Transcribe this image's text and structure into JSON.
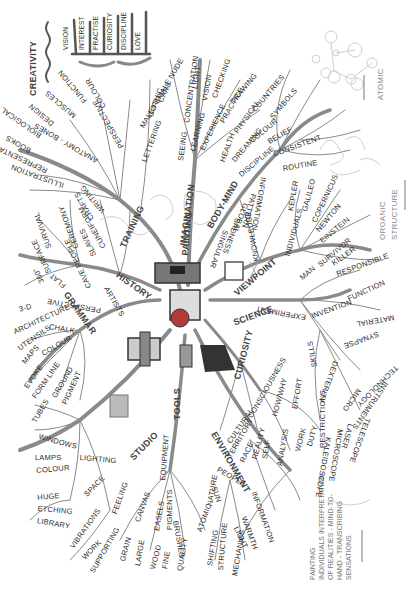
{
  "central_topic": "Painting",
  "legend": {
    "creativity": "CREATIVITY",
    "bars": [
      "VISION",
      "INTEREST",
      "PRACTISE",
      "CURIOSITY",
      "DISCIPLINE",
      "LOVE"
    ]
  },
  "corner_labels": {
    "atomic": "ATOMIC",
    "organic_structure_1": "ORGANIC",
    "organic_structure_2": "STRUCTURE"
  },
  "definition": {
    "title": "PAINTING",
    "lines": [
      "INDIVIDUALS INTERPRETATION",
      "OF REALITIES - MIND-TO-",
      "HAND - TRANSCRIBING",
      "SENSATIONS."
    ]
  },
  "branches": {
    "training": {
      "label": "TRAINING",
      "sub": {
        "illustration": "ILLUSTRATION",
        "representational": "REPRESENTATIONAL",
        "books": "BOOKS",
        "biological": "BIOLOGICAL",
        "design": "DESIGN",
        "anatomy": "ANATOMY - BONES",
        "muscles": "MUSCLES",
        "function": "FUNCTION",
        "perspective": "PERSPECTIVE",
        "colour": "COLOUR",
        "lettering": "LETTERING",
        "gothic": "GOTHIC",
        "cars": "CARS",
        "male_female_nude": "MALE/FEMALE NUDE"
      }
    },
    "imagination": {
      "label": "IMAGINATION",
      "sub": {
        "seeing": "SEEING",
        "concentration": "CONCENTRATION",
        "light": "LIGHT",
        "vision": "VISION",
        "checking": "CHECKING",
        "learning": "LEARNING",
        "experience": "EXPERIENCE",
        "practice": "PRACTICE",
        "drawing": "DRAWING"
      }
    },
    "body_mind": {
      "label": "BODY-MIND",
      "sub": {
        "health": "HEALTH",
        "physical": "PHYSICAL",
        "countries": "COUNTRIES",
        "dreaming": "DREAMING",
        "colour": "COLOUR",
        "symbols": "SYMBOLS",
        "discipline": "DISCIPLINE",
        "belief": "BELIEF",
        "consistent": "CONSISTENT",
        "routine": "ROUTINE"
      }
    },
    "viewpoint": {
      "label": "VIEWPOINT",
      "sub": {
        "knowledge": "KNOWLEDGE",
        "singular": "SINGULAR",
        "sadness": "SADNESS",
        "global": "GLOBAL",
        "pattern": "PATTERN",
        "information": "INFORMATION",
        "individuals": "INDIVIDUALS",
        "kepler": "KEPLER",
        "galileo": "GALILEO",
        "copernicus": "COPERNICUS",
        "newton": "NEWTON",
        "einstein": "EINSTEIN",
        "man": "MAN",
        "survivor": "SURVIVOR",
        "killer": "KILLER",
        "responsible": "RESPONSIBLE"
      }
    },
    "science": {
      "label": "SCIENCE",
      "sub": {
        "experiment": "EXPERIMENT",
        "invention": "INVENTION",
        "function": "FUNCTION",
        "material": "MATERIAL",
        "synapse": "SYNAPSE",
        "dexterity": "DEXTERITY",
        "technology": "TECHNOLOGY",
        "instruments": "INSTRUMENTS",
        "micro": "MICRO",
        "skills": "SKILLS",
        "telescope": "TELESCOPE",
        "laser": "LASER",
        "microscope": "MICROSCOPE",
        "kaleidoscope": "KALEIDOSCOPE"
      }
    },
    "curiosity": {
      "label": "CURIOSITY",
      "sub": {
        "consciousness": "CONSCIOUSNESS",
        "cultural": "CULTURAL",
        "territory": "TERRITORY",
        "race": "RACE",
        "reality": "REALITY",
        "self": "SELF",
        "how_why": "HOW/WHY",
        "analysis": "ANALYSIS",
        "effort": "EFFORT",
        "work": "WORK",
        "duty": "DUTY",
        "restrictions": "RESTRICTIONS"
      }
    },
    "environment": {
      "label": "ENVIRONMENT",
      "sub": {
        "people": "PEOPLE",
        "sun": "SUN",
        "information": "INFORMATION",
        "warmth": "WARMTH",
        "light": "LIGHT",
        "nature": "NATURE",
        "atomic": "ATOMIC",
        "shifting": "SHIFTING",
        "structure": "STRUCTURE",
        "mechanics": "MECHANICS"
      }
    },
    "tools": {
      "label": "TOOLS",
      "sub": {
        "equipment": "EQUIPMENT",
        "canvas": "CANVAS",
        "grain": "GRAIN",
        "large": "LARGE",
        "easels": "EASELS",
        "wood": "WOOD",
        "pigments": "PIGMENTS",
        "fine": "FINE",
        "quality": "QUALITY",
        "brushes": "BRUSHES"
      }
    },
    "studio": {
      "label": "STUDIO",
      "sub": {
        "lighting": "LIGHTING",
        "windows": "WINDOWS",
        "lamps": "LAMPS",
        "colour": "COLOUR",
        "space": "SPACE",
        "huge": "HUGE",
        "etching": "ETCHING",
        "library": "LIBRARY",
        "feeling": "FEELING",
        "vibrations": "VIBRATIONS",
        "work": "WORK",
        "supporting": "SUPPORTING"
      }
    },
    "grammar": {
      "label": "GRAMMAR",
      "sub": {
        "chalk": "CHALK",
        "utensils": "UTENSILS",
        "maps": "MAPS",
        "colour": "COLOUR",
        "evoke": "EVOKE",
        "form_line": "FORM LINE",
        "ground": "GROUND",
        "tubes": "TUBES",
        "pigment": "PIGMENT"
      }
    },
    "history": {
      "label": "HISTORY",
      "sub": {
        "artists": "ARTISTS",
        "perspective": "PERSPECTIVE",
        "architecture": "ARCHITECTURE",
        "three_d": "3-D",
        "flat": "FLAT",
        "three_sixty": "360°",
        "surface": "SURFACE",
        "cave_people": "CAVE PEOPLE",
        "slaves": "SLAVES",
        "ceremony": "CEREMONY",
        "cuneiform": "CUNEIFORM",
        "crafts": "CRAFTS",
        "writing": "WRITING",
        "survival": "SURVIVAL"
      }
    }
  },
  "colors": {
    "branch": "#8a8a8a",
    "branch_dark": "#555555",
    "text": "#2e2e2e",
    "faint": "#bbbbbb",
    "icon_red": "#b33a3a",
    "icon_dark": "#333333"
  }
}
